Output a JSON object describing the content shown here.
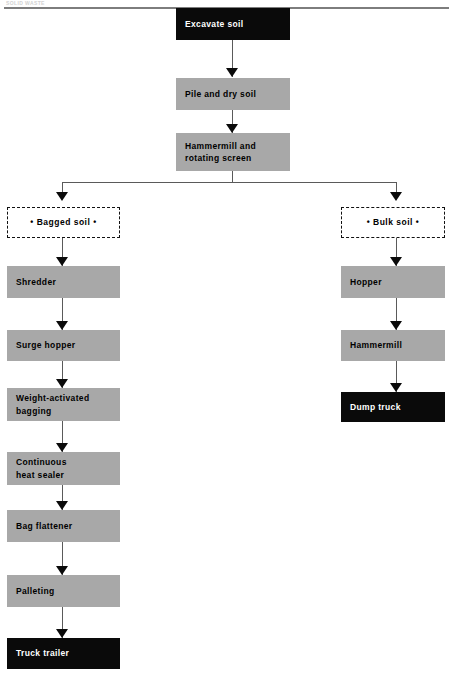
{
  "page": {
    "header_text": "SOLID WASTE",
    "width": 453,
    "height": 676
  },
  "colors": {
    "dark_fill": "#0a0a0a",
    "gray_fill": "#a8a8a8",
    "line": "#5a5a5a",
    "arrow": "#0a0a0a",
    "background": "#ffffff"
  },
  "flowchart": {
    "type": "process-flow-diagram",
    "orientation": "top-down",
    "trunk": [
      {
        "id": "excavate",
        "label": "Excavate soil",
        "style": "dark"
      },
      {
        "id": "pile",
        "label": "Pile and dry soil",
        "style": "gray"
      },
      {
        "id": "hammermill_screen",
        "label": "Hammermill and\nrotating screen",
        "style": "gray"
      }
    ],
    "branches": [
      {
        "id": "bagged",
        "header": "• Bagged soil •",
        "header_style": "dashed",
        "steps": [
          {
            "id": "shredder",
            "label": "Shredder",
            "style": "gray"
          },
          {
            "id": "surge-hopper",
            "label": "Surge hopper",
            "style": "gray"
          },
          {
            "id": "weight-bagging",
            "label": "Weight-activated\nbagging",
            "style": "gray"
          },
          {
            "id": "heat-sealer",
            "label": "Continuous\nheat sealer",
            "style": "gray"
          },
          {
            "id": "bag-flattener",
            "label": "Bag flattener",
            "style": "gray"
          },
          {
            "id": "palleting",
            "label": "Palleting",
            "style": "gray"
          },
          {
            "id": "truck-trailer",
            "label": "Truck trailer",
            "style": "dark"
          }
        ]
      },
      {
        "id": "bulk",
        "header": "• Bulk soil •",
        "header_style": "dashed",
        "steps": [
          {
            "id": "hopper",
            "label": "Hopper",
            "style": "gray"
          },
          {
            "id": "hammermill",
            "label": "Hammermill",
            "style": "gray"
          },
          {
            "id": "dump-truck",
            "label": "Dump truck",
            "style": "dark"
          }
        ]
      }
    ]
  }
}
